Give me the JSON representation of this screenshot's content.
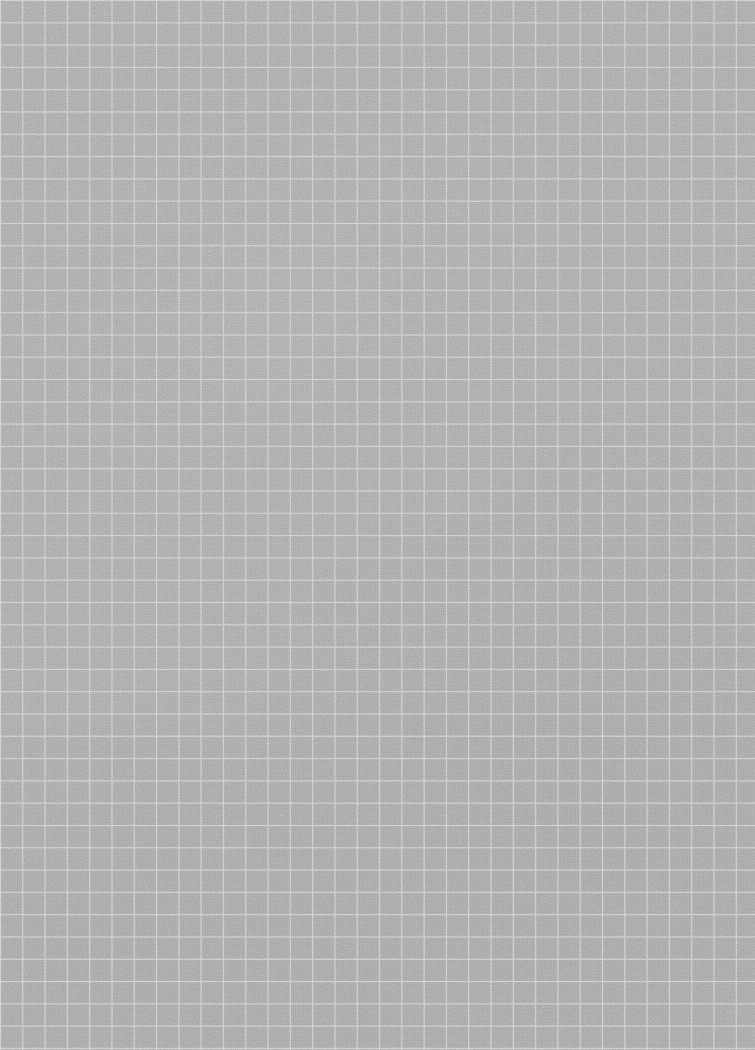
{
  "document": {
    "title": "Grid Paper Background",
    "kind": "graph-paper-texture",
    "description": "Uniform grey graph paper / grid sheet with no text or UI controls",
    "width_px": 755,
    "height_px": 1050,
    "text_content": "",
    "visible_labels": []
  },
  "appearance": {
    "paper_color": "#a7a8a8",
    "grid_line_color": "#cecfce",
    "grid_bleed_color": "#c6c7c6",
    "vignette_color": "#000000",
    "grid_pitch_px": 22.3,
    "grid_line_width_px": 1,
    "grid_origin_x_px": 0,
    "grid_origin_y_px": 0,
    "columns": 34,
    "rows": 47,
    "texture": "fine paper fibre noise",
    "noise_opacity": 0.5
  }
}
